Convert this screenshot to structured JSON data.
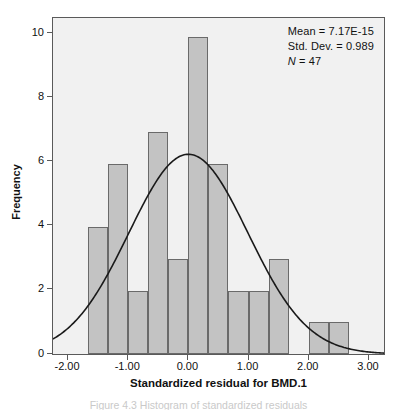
{
  "chart_data": {
    "type": "bar",
    "title": "",
    "subtitle": "",
    "xlabel": "Standardized residual for BMD.1",
    "ylabel": "Frequency",
    "xlim": [
      -2.25,
      3.25
    ],
    "ylim": [
      0,
      10.6
    ],
    "grid": false,
    "legend": "none",
    "x_ticks": [
      "-2.00",
      "-1.00",
      "0.00",
      "1.00",
      "2.00",
      "3.00"
    ],
    "x_tick_values": [
      -2.0,
      -1.0,
      0.0,
      1.0,
      2.0,
      3.0
    ],
    "y_ticks": [
      "0",
      "2",
      "4",
      "6",
      "8",
      "10"
    ],
    "y_tick_values": [
      0,
      2,
      4,
      6,
      8,
      10
    ],
    "bin_width": 0.333,
    "bars": [
      {
        "bin_start": -1.665,
        "bin_end": -1.332,
        "value": 4
      },
      {
        "bin_start": -1.332,
        "bin_end": -0.999,
        "value": 6
      },
      {
        "bin_start": -0.999,
        "bin_end": -0.666,
        "value": 2
      },
      {
        "bin_start": -0.666,
        "bin_end": -0.333,
        "value": 7
      },
      {
        "bin_start": -0.333,
        "bin_end": 0.0,
        "value": 3
      },
      {
        "bin_start": 0.0,
        "bin_end": 0.333,
        "value": 10
      },
      {
        "bin_start": 0.333,
        "bin_end": 0.666,
        "value": 6
      },
      {
        "bin_start": 0.666,
        "bin_end": 0.999,
        "value": 2
      },
      {
        "bin_start": 0.999,
        "bin_end": 1.332,
        "value": 2
      },
      {
        "bin_start": 1.332,
        "bin_end": 1.665,
        "value": 3
      },
      {
        "bin_start": 1.998,
        "bin_end": 2.331,
        "value": 1
      },
      {
        "bin_start": 2.331,
        "bin_end": 2.664,
        "value": 1
      }
    ],
    "normal_curve": {
      "mean": 0.0,
      "std_dev": 0.989,
      "peak_value": 6.3,
      "description": "Normal distribution overlay curve"
    },
    "colors": {
      "bar_fill": "#c3c3c3",
      "bar_edge": "#6a6a6a",
      "plot_background": "#f1f1f1",
      "curve": "#1a1a1a",
      "axis": "#5a5a5a",
      "text": "#111111"
    }
  },
  "stats_box": {
    "mean_label": "Mean = 7.17E-15",
    "std_dev_label": "Std. Dev. = 0.989",
    "n_symbol": "N",
    "n_value": " = 47"
  },
  "caption": {
    "partial_text": "Figure 4.3  Histogram of standardized residuals"
  }
}
